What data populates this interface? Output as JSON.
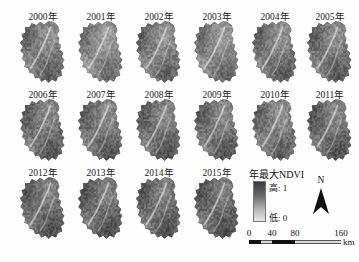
{
  "figure": {
    "background": "#fdfdfd",
    "width": 359,
    "height": 262
  },
  "chart_data": {
    "type": "heatmap",
    "title": "年最大NDVI",
    "subtitle": "",
    "xlabel": "",
    "ylabel": "",
    "variable": "年最大NDVI",
    "value_range": [
      0,
      1
    ],
    "colormap": "grayscale dark=high, light=low",
    "panel_layout": {
      "rows": 3,
      "cols": 6,
      "panels": 16
    },
    "panels": [
      {
        "label": "2000年",
        "year": 2000,
        "row": 0,
        "col": 0,
        "mean_ndvi": 0.62
      },
      {
        "label": "2001年",
        "year": 2001,
        "row": 0,
        "col": 1,
        "mean_ndvi": 0.55
      },
      {
        "label": "2002年",
        "year": 2002,
        "row": 0,
        "col": 2,
        "mean_ndvi": 0.6
      },
      {
        "label": "2003年",
        "year": 2003,
        "row": 0,
        "col": 3,
        "mean_ndvi": 0.57
      },
      {
        "label": "2004年",
        "year": 2004,
        "row": 0,
        "col": 4,
        "mean_ndvi": 0.63
      },
      {
        "label": "2005年",
        "year": 2005,
        "row": 0,
        "col": 5,
        "mean_ndvi": 0.64
      },
      {
        "label": "2006年",
        "year": 2006,
        "row": 1,
        "col": 0,
        "mean_ndvi": 0.66
      },
      {
        "label": "2007年",
        "year": 2007,
        "row": 1,
        "col": 1,
        "mean_ndvi": 0.65
      },
      {
        "label": "2008年",
        "year": 2008,
        "row": 1,
        "col": 2,
        "mean_ndvi": 0.67
      },
      {
        "label": "2009年",
        "year": 2009,
        "row": 1,
        "col": 3,
        "mean_ndvi": 0.66
      },
      {
        "label": "2010年",
        "year": 2010,
        "row": 1,
        "col": 4,
        "mean_ndvi": 0.62
      },
      {
        "label": "2011年",
        "year": 2011,
        "row": 1,
        "col": 5,
        "mean_ndvi": 0.68
      },
      {
        "label": "2012年",
        "year": 2012,
        "row": 2,
        "col": 0,
        "mean_ndvi": 0.69
      },
      {
        "label": "2013年",
        "year": 2013,
        "row": 2,
        "col": 1,
        "mean_ndvi": 0.7
      },
      {
        "label": "2014年",
        "year": 2014,
        "row": 2,
        "col": 2,
        "mean_ndvi": 0.69
      },
      {
        "label": "2015年",
        "year": 2015,
        "row": 2,
        "col": 3,
        "mean_ndvi": 0.71
      }
    ]
  },
  "legend": {
    "title": "年最大NDVI",
    "high_label": "高: 1",
    "low_label": "低: 0",
    "ramp_top_color": "#3a3a3a",
    "ramp_bottom_color": "#e8e8e8"
  },
  "north_arrow": {
    "letter": "N"
  },
  "scalebar": {
    "ticks": [
      "0",
      "40",
      "80",
      "160"
    ],
    "unit": "km",
    "segments": [
      {
        "length_km": 20,
        "style": "dark"
      },
      {
        "length_km": 20,
        "style": "light"
      },
      {
        "length_km": 40,
        "style": "dark"
      },
      {
        "length_km": 80,
        "style": "light"
      }
    ]
  }
}
